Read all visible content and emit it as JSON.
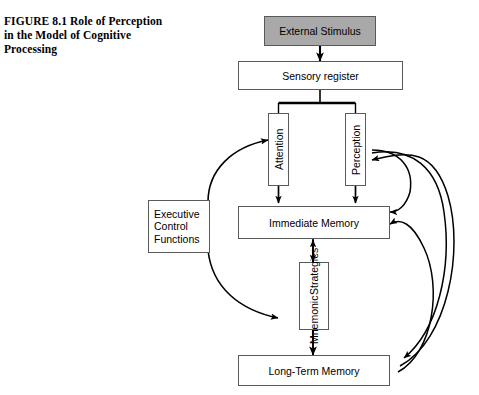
{
  "figure": {
    "number": "FIGURE 8.1",
    "title_line1": "Role of",
    "title_line2": "Perception in the Model",
    "title_line3": "of Cognitive Processing",
    "full_caption": "FIGURE 8.1  Role of Perception in the Model of Cognitive Processing"
  },
  "diagram": {
    "type": "flowchart",
    "colors": {
      "shaded_fill": "#a9a9a9",
      "node_fill": "#ffffff",
      "node_stroke": "#5a5a5a",
      "connector_stroke": "#000000"
    },
    "nodes": [
      {
        "id": "external_stimulus",
        "label": "External Stimulus",
        "shape": "rect",
        "orientation": "horizontal",
        "fill": "shaded"
      },
      {
        "id": "sensory_register",
        "label": "Sensory register",
        "shape": "rect",
        "orientation": "horizontal",
        "fill": "white"
      },
      {
        "id": "attention",
        "label": "Attention",
        "shape": "rect",
        "orientation": "vertical",
        "fill": "white"
      },
      {
        "id": "perception",
        "label": "Perception",
        "shape": "rect",
        "orientation": "vertical",
        "fill": "white"
      },
      {
        "id": "immediate_memory",
        "label": "Immediate Memory",
        "shape": "rect",
        "orientation": "horizontal",
        "fill": "white"
      },
      {
        "id": "executive_control",
        "label_line1": "Executive",
        "label_line2": "Control",
        "label_line3": "Functions",
        "shape": "rect",
        "orientation": "horizontal",
        "fill": "white"
      },
      {
        "id": "mnemonic_strategies",
        "label_line1": "Mnemonic",
        "label_line2": "Strategies",
        "shape": "rect",
        "orientation": "vertical",
        "fill": "white"
      },
      {
        "id": "long_term_memory",
        "label": "Long-Term Memory",
        "shape": "rect",
        "orientation": "horizontal",
        "fill": "white"
      }
    ],
    "edges": [
      {
        "from": "external_stimulus",
        "to": "sensory_register",
        "style": "straight-down",
        "arrow": "single"
      },
      {
        "from": "sensory_register",
        "to": "attention",
        "style": "bus-down",
        "arrow": "single"
      },
      {
        "from": "sensory_register",
        "to": "perception",
        "style": "bus-down",
        "arrow": "single"
      },
      {
        "from": "attention",
        "to": "immediate_memory",
        "style": "straight-down",
        "arrow": "single"
      },
      {
        "from": "perception",
        "to": "immediate_memory",
        "style": "straight-down",
        "arrow": "single"
      },
      {
        "from": "immediate_memory",
        "to": "mnemonic_strategies",
        "style": "straight-down",
        "arrow": "single"
      },
      {
        "from": "mnemonic_strategies",
        "to": "immediate_memory",
        "style": "straight-up",
        "arrow": "single"
      },
      {
        "from": "mnemonic_strategies",
        "to": "long_term_memory",
        "style": "straight-down",
        "arrow": "single"
      },
      {
        "from": "executive_control",
        "to": "attention",
        "style": "curve-up-right",
        "arrow": "single"
      },
      {
        "from": "executive_control",
        "to": "mnemonic_strategies",
        "style": "curve-down-right",
        "arrow": "single"
      },
      {
        "from": "long_term_memory",
        "to": "perception",
        "style": "arc-right-outer",
        "arrow": "single"
      },
      {
        "from": "long_term_memory",
        "to": "immediate_memory",
        "style": "arc-right-inner",
        "arrow": "single"
      },
      {
        "from": "perception",
        "to": "long_term_memory",
        "style": "arc-right-down",
        "arrow": "single"
      },
      {
        "from": "immediate_memory",
        "to": "long_term_memory",
        "style": "arc-right-down2",
        "arrow": "single"
      }
    ]
  }
}
